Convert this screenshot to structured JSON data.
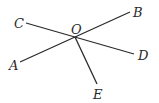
{
  "diagram": {
    "type": "geometry-rays",
    "center": {
      "name": "O",
      "x": 75,
      "y": 37,
      "label": "O",
      "label_x": 71,
      "label_y": 34
    },
    "points": [
      {
        "name": "A",
        "label": "A",
        "x": 20,
        "y": 62,
        "label_x": 9,
        "label_y": 70
      },
      {
        "name": "B",
        "label": "B",
        "x": 130,
        "y": 12,
        "label_x": 133,
        "label_y": 17
      },
      {
        "name": "C",
        "label": "C",
        "x": 26,
        "y": 23,
        "label_x": 14,
        "label_y": 28
      },
      {
        "name": "D",
        "label": "D",
        "x": 134,
        "y": 54,
        "label_x": 138,
        "label_y": 60
      },
      {
        "name": "E",
        "label": "E",
        "x": 97,
        "y": 84,
        "label_x": 93,
        "label_y": 99
      }
    ],
    "segments": [
      {
        "from": "A",
        "to": "B",
        "note": "straight line AB through O"
      },
      {
        "from": "C",
        "to": "D",
        "note": "straight line CD through O"
      },
      {
        "from": "O",
        "to": "E",
        "note": "ray OE"
      }
    ],
    "colors": {
      "line": "#2a2a2a",
      "background": "#ffffff"
    }
  }
}
